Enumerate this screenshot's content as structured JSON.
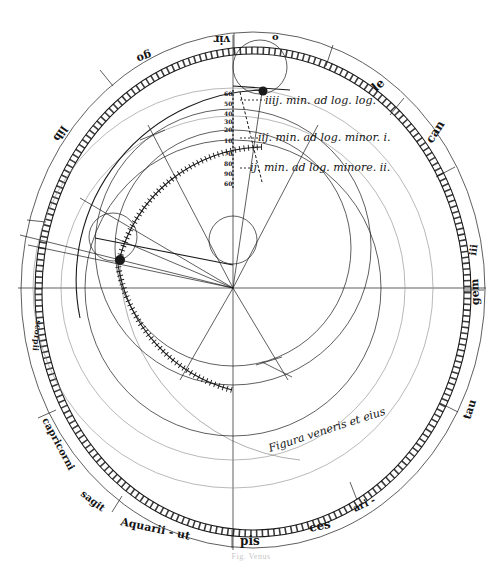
{
  "figure": {
    "caption": "Fig. Venus",
    "inscription": "Figura veneris et eius",
    "center": {
      "x": 233,
      "y": 287
    },
    "colors": {
      "ink": "#1a1a1a",
      "faint": "#8a8a8a",
      "paper": "#ffffff"
    }
  },
  "rim_labels": [
    {
      "text": "Aquarii - ut",
      "x": 120,
      "y": 525,
      "rot": 12
    },
    {
      "text": "pis",
      "x": 240,
      "y": 540,
      "rot": 0
    },
    {
      "text": "ces",
      "x": 318,
      "y": 528,
      "rot": -10
    },
    {
      "text": "ari -",
      "x": 360,
      "y": 507,
      "rot": -25
    },
    {
      "text": "tau",
      "x": 450,
      "y": 415,
      "rot": -65
    },
    {
      "text": "gem",
      "x": 467,
      "y": 290,
      "rot": -90
    },
    {
      "text": "iii",
      "x": 460,
      "y": 250,
      "rot": -80
    },
    {
      "text": "can",
      "x": 428,
      "y": 140,
      "rot": -55
    },
    {
      "text": "le",
      "x": 388,
      "y": 95,
      "rot": -40
    },
    {
      "text": "o",
      "x": 274,
      "y": 32,
      "rot": 0
    },
    {
      "text": "vir",
      "x": 228,
      "y": 38,
      "rot": 180
    },
    {
      "text": "go",
      "x": 140,
      "y": 53,
      "rot": 160
    },
    {
      "text": "lib",
      "x": 60,
      "y": 125,
      "rot": 125
    },
    {
      "text": "scorpii",
      "x": 45,
      "y": 360,
      "rot": 100
    },
    {
      "text": "capricorni",
      "x": 55,
      "y": 455,
      "rot": 60
    },
    {
      "text": "sagit",
      "x": 90,
      "y": 500,
      "rot": 40
    }
  ],
  "annotations": [
    {
      "text": "iiij. min. ad log. log.",
      "x": 268,
      "y": 104
    },
    {
      "text": "iij. min. ad log. minor. i.",
      "x": 258,
      "y": 140
    },
    {
      "text": "ij. min. ad log. minore. ii.",
      "x": 250,
      "y": 170
    }
  ],
  "scale_numbers": [
    "60",
    "50",
    "40",
    "30",
    "20",
    "10",
    "70",
    "80",
    "90",
    "60"
  ]
}
